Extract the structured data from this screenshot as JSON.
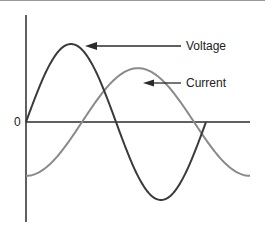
{
  "diagram": {
    "title": "",
    "zero_label": "0",
    "colors": {
      "axis": "#2b2b2b",
      "voltage": "#3a3a3a",
      "current": "#8a8a8a",
      "top_border": "#9a9a9a",
      "text": "#222222"
    },
    "series": [
      {
        "name": "Voltage",
        "label": "Voltage",
        "phase_deg": 0,
        "amplitude": 1.0,
        "cycles": 1.0
      },
      {
        "name": "Current",
        "label": "Current",
        "phase_deg": -90,
        "amplitude": 0.69,
        "cycles": 1.0
      }
    ]
  }
}
